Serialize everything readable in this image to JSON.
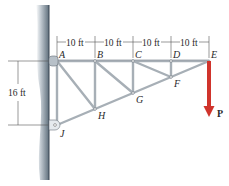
{
  "figure": {
    "type": "cantilever truss",
    "joints": [
      {
        "name": "A",
        "label": "A"
      },
      {
        "name": "B",
        "label": "B"
      },
      {
        "name": "C",
        "label": "C"
      },
      {
        "name": "D",
        "label": "D"
      },
      {
        "name": "E",
        "label": "E"
      },
      {
        "name": "F",
        "label": "F"
      },
      {
        "name": "G",
        "label": "G"
      },
      {
        "name": "H",
        "label": "H"
      },
      {
        "name": "J",
        "label": "J"
      }
    ],
    "dimensions": {
      "horizontal": [
        "10 ft",
        "10 ft",
        "10 ft",
        "10 ft"
      ],
      "vertical": "16 ft"
    },
    "load": {
      "label": "P",
      "direction": "down",
      "color": "#d0342c"
    },
    "colors": {
      "member": "#a7afb6",
      "wall": "#5c6e7d",
      "text": "#2a2a2a",
      "load": "#d0342c"
    }
  }
}
